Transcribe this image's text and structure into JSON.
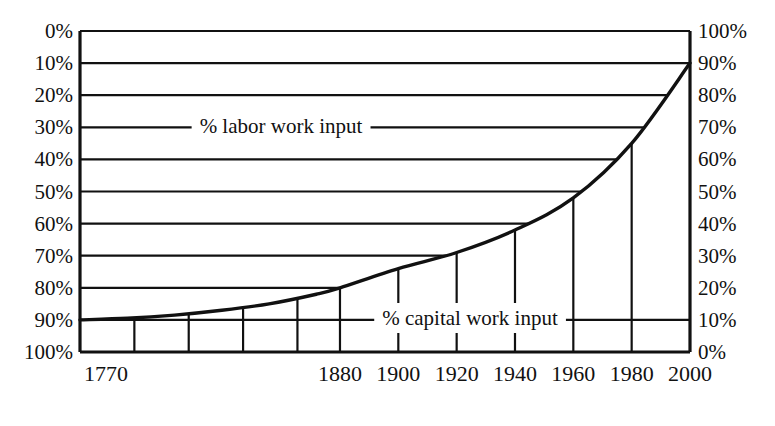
{
  "chart_data": {
    "type": "area",
    "title": "",
    "subtitle": "",
    "xlabel": "",
    "ylabel": "",
    "xlim": [
      1770,
      2000
    ],
    "ylim": [
      0,
      100
    ],
    "grid": true,
    "legend_position": "inline",
    "left_axis": {
      "name": "% labor work input",
      "direction": "inverted",
      "ticks": [
        "0%",
        "10%",
        "20%",
        "30%",
        "40%",
        "50%",
        "60%",
        "70%",
        "80%",
        "90%",
        "100%"
      ],
      "tick_values": [
        0,
        10,
        20,
        30,
        40,
        50,
        60,
        70,
        80,
        90,
        100
      ]
    },
    "right_axis": {
      "name": "% capital work input",
      "direction": "normal",
      "ticks": [
        "100%",
        "90%",
        "80%",
        "70%",
        "60%",
        "50%",
        "40%",
        "30%",
        "20%",
        "10%",
        "0%"
      ],
      "tick_values": [
        100,
        90,
        80,
        70,
        60,
        50,
        40,
        30,
        20,
        10,
        0
      ]
    },
    "x_ticks": [
      "1770",
      "1880",
      "1900",
      "1920",
      "1940",
      "1960",
      "1980",
      "2000"
    ],
    "x_tick_values": [
      1770,
      1880,
      1900,
      1920,
      1940,
      1960,
      1980,
      2000
    ],
    "series": [
      {
        "name": "% capital work input",
        "x": [
          1770,
          1790,
          1810,
          1830,
          1850,
          1870,
          1880,
          1900,
          1920,
          1940,
          1960,
          1980,
          2000
        ],
        "values": [
          10,
          10.5,
          11.5,
          13,
          15,
          18,
          20,
          26,
          31,
          38,
          48,
          65,
          90
        ]
      },
      {
        "name": "% labor work input",
        "x": [
          1770,
          1790,
          1810,
          1830,
          1850,
          1870,
          1880,
          1900,
          1920,
          1940,
          1960,
          1980,
          2000
        ],
        "values": [
          90,
          89.5,
          88.5,
          87,
          85,
          82,
          80,
          74,
          69,
          62,
          52,
          35,
          10
        ]
      }
    ],
    "annotations": [
      {
        "text": "% labor work input",
        "region": "upper"
      },
      {
        "text": "% capital work input",
        "region": "lower"
      }
    ]
  },
  "labels": {
    "left": [
      "0%",
      "10%",
      "20%",
      "30%",
      "40%",
      "50%",
      "60%",
      "70%",
      "80%",
      "90%",
      "100%"
    ],
    "right": [
      "100%",
      "90%",
      "80%",
      "70%",
      "60%",
      "50%",
      "40%",
      "30%",
      "20%",
      "10%",
      "0%"
    ],
    "years": [
      "1770",
      "1880",
      "1900",
      "1920",
      "1940",
      "1960",
      "1980",
      "2000"
    ],
    "labor_series": "% labor work input",
    "capital_series": "% capital work input"
  },
  "colors": {
    "line": "#111111",
    "grid": "#111111",
    "background": "#ffffff",
    "text": "#111111"
  }
}
